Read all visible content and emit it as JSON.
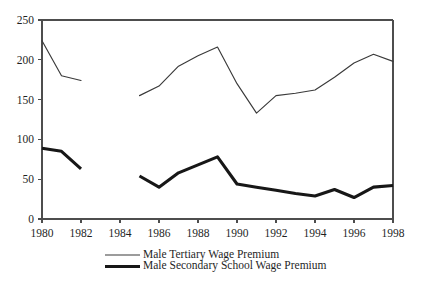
{
  "chart_data": {
    "type": "line",
    "title": "",
    "subtitle": "",
    "xlabel": "",
    "ylabel": "",
    "xlim": [
      1980,
      1998
    ],
    "ylim": [
      0,
      250
    ],
    "y_ticks": [
      0,
      50,
      100,
      150,
      200,
      250
    ],
    "x_ticks": [
      1980,
      1982,
      1984,
      1986,
      1988,
      1990,
      1992,
      1994,
      1996,
      1998
    ],
    "x_tick_labels": [
      "1980",
      "1982",
      "1984",
      "1986",
      "1988",
      "1990",
      "1992",
      "1994",
      "1996",
      "1998"
    ],
    "y_tick_labels": [
      "0",
      "50",
      "100",
      "150",
      "200",
      "250"
    ],
    "grid": false,
    "legend_position": "bottom",
    "series": [
      {
        "name": "Male Tertiary Wage Premium",
        "style": "thin",
        "color": "#3a3a3a",
        "segments": [
          {
            "x": [
              1980,
              1981,
              1982
            ],
            "values": [
              224,
              180,
              174
            ]
          },
          {
            "x": [
              1985,
              1986,
              1987,
              1988,
              1989,
              1990,
              1991,
              1992,
              1993,
              1994,
              1995,
              1996,
              1997,
              1998
            ],
            "values": [
              155,
              167,
              192,
              205,
              216,
              170,
              133,
              155,
              158,
              162,
              178,
              196,
              207,
              198
            ]
          }
        ]
      },
      {
        "name": "Male Secondary School Wage Premium",
        "style": "thick",
        "color": "#171717",
        "segments": [
          {
            "x": [
              1980,
              1981,
              1982
            ],
            "values": [
              89,
              85,
              63
            ]
          },
          {
            "x": [
              1985,
              1986,
              1987,
              1988,
              1989,
              1990,
              1991,
              1992,
              1993,
              1994,
              1995,
              1996,
              1997,
              1998
            ],
            "values": [
              54,
              40,
              58,
              68,
              78,
              44,
              40,
              36,
              32,
              29,
              37,
              27,
              40,
              42
            ]
          }
        ]
      }
    ]
  },
  "legend": {
    "items": [
      {
        "label": "Male Tertiary Wage Premium",
        "style": "thin"
      },
      {
        "label": "Male Secondary School Wage Premium",
        "style": "thick"
      }
    ]
  }
}
